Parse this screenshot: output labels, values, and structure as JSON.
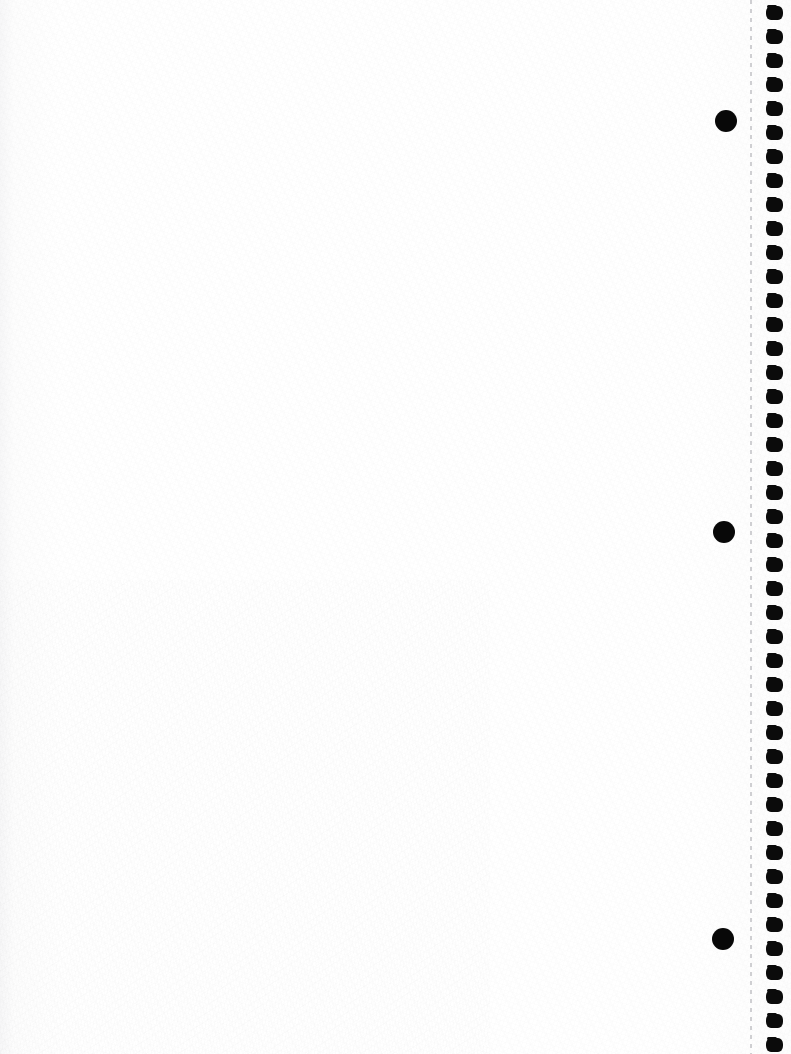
{
  "document": {
    "title": "Scanned notebook page",
    "page_kind": "blank spiral-bound notebook sheet",
    "orientation": "portrait",
    "width_px": 791,
    "height_px": 1054,
    "body_text": "",
    "visible_text": "",
    "paper_color": "#fefefe",
    "ink_color": "#080808"
  },
  "perforation": {
    "name": "tear-off perforation line",
    "style": "dashed",
    "color": "#cfcfd2",
    "x_px": 750,
    "width_px": 2,
    "dash_px": 4,
    "gap_px": 5
  },
  "binding": {
    "name": "spiral binding hole column",
    "hole_shape": "rounded-rectangle",
    "hole_color": "#0b0b0b",
    "hole_count": 44,
    "hole_width_px": 17,
    "hole_height_px": 14,
    "pitch_px": 24,
    "first_hole_center_y_px": 13,
    "column_left_px": 766
  },
  "ink_dots": {
    "name": "large filled circles",
    "color": "#080808",
    "count": 3,
    "radius_px": 11,
    "items": [
      {
        "label": "ink-dot-top",
        "cx": 726,
        "cy": 121,
        "r": 11
      },
      {
        "label": "ink-dot-middle",
        "cx": 724,
        "cy": 532,
        "r": 11
      },
      {
        "label": "ink-dot-bottom",
        "cx": 723,
        "cy": 939,
        "r": 11
      }
    ]
  }
}
